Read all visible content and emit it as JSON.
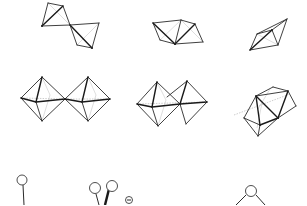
{
  "figure": {
    "rows": [
      {
        "name": "tetrahedra",
        "panels": [
          {
            "id": "corner-sharing-tetrahedra",
            "connection": "corner-sharing"
          },
          {
            "id": "edge-sharing-tetrahedra",
            "connection": "edge-sharing"
          },
          {
            "id": "face-sharing-tetrahedra",
            "connection": "face-sharing"
          }
        ]
      },
      {
        "name": "octahedra",
        "panels": [
          {
            "id": "corner-sharing-octahedra",
            "connection": "corner-sharing"
          },
          {
            "id": "edge-sharing-octahedra",
            "connection": "edge-sharing"
          },
          {
            "id": "face-sharing-octahedra",
            "connection": "face-sharing"
          }
        ]
      },
      {
        "name": "ligands",
        "panels": [
          {
            "id": "monodentate-ligand",
            "atoms": 1
          },
          {
            "id": "bidentate-ligand-with-charge",
            "atoms": 2,
            "charge_symbol": "⊖"
          },
          {
            "id": "bridging-ligand",
            "atoms": 1
          }
        ]
      }
    ],
    "colors": {
      "background": "#ffffff",
      "line": "#2a2a2a",
      "hidden_line": "#b8b8b8"
    }
  }
}
